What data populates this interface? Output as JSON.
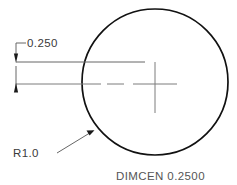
{
  "drawing": {
    "type": "cad-technical-drawing",
    "title_note": "DIMCEN  0.2500",
    "background_color": "#ffffff",
    "object_line_color": "#111111",
    "dimension_line_color": "#666666",
    "center_mark_color": "#7d7d7d",
    "text_color": "#3a3a3a",
    "circle": {
      "name": "primary-circle",
      "center_x": 155,
      "center_y": 82,
      "radius": 73,
      "radius_label": "R1.0"
    },
    "center_mark": {
      "name": "center-mark",
      "size": 0.25,
      "horizontal_extent": 22,
      "vertical_extent": 30
    },
    "dimensions": [
      {
        "name": "center-mark-extension-dim",
        "value": "0.250",
        "style": "leader-with-arrows",
        "arrow_top_y": 62,
        "arrow_bottom_y": 84,
        "extension_x": 16
      }
    ],
    "leaders": [
      {
        "name": "radius-leader",
        "label": "R1.0",
        "from_x": 60,
        "from_y": 152,
        "to_x": 94,
        "to_y": 131
      }
    ],
    "labels": {
      "dim_value": "0.250",
      "radius_value": "R1.0",
      "system_variable": "DIMCEN  0.2500"
    }
  }
}
